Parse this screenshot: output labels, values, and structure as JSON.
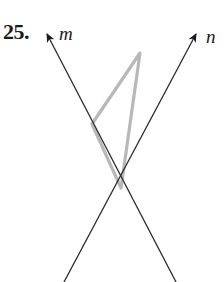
{
  "problem": {
    "number": "25."
  },
  "lines": [
    {
      "name": "m",
      "label": "m",
      "arrow_tip": [
        47,
        33
      ],
      "end": [
        176,
        282
      ],
      "color": "#2a2a2a"
    },
    {
      "name": "n",
      "label": "n",
      "arrow_tip": [
        197,
        33
      ],
      "end": [
        64,
        282
      ],
      "color": "#2a2a2a"
    }
  ],
  "intersection": [
    121,
    188
  ],
  "triangle": {
    "vertices": [
      [
        140,
        53
      ],
      [
        92,
        124
      ],
      [
        121,
        188
      ]
    ],
    "color": "#b3b3b3"
  }
}
